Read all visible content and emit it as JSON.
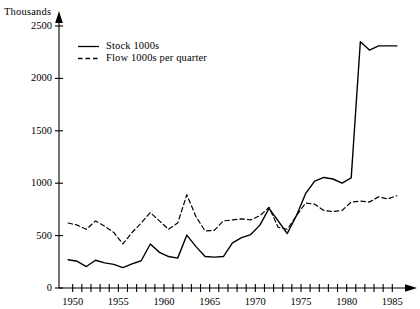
{
  "chart_data": {
    "type": "line",
    "title": "",
    "xlabel": "",
    "ylabel": "Thousands",
    "xlim": [
      1948.5,
      1986.5
    ],
    "ylim": [
      0,
      2500
    ],
    "grid": false,
    "legend_position": "top-left-inside",
    "y_ticks": [
      0,
      500,
      1000,
      1500,
      2000,
      2500
    ],
    "y_tick_labels": [
      "0",
      "500",
      "1000",
      "1500",
      "2000",
      "2500"
    ],
    "x_ticks": [
      1950,
      1951,
      1952,
      1953,
      1954,
      1955,
      1956,
      1957,
      1958,
      1959,
      1960,
      1961,
      1962,
      1963,
      1964,
      1965,
      1966,
      1967,
      1968,
      1969,
      1970,
      1971,
      1972,
      1973,
      1974,
      1975,
      1976,
      1977,
      1978,
      1979,
      1980,
      1981,
      1982,
      1983,
      1984,
      1985
    ],
    "x_tick_labels_shown": [
      "1950",
      "1955",
      "1960",
      "1965",
      "1970",
      "1975",
      "1980",
      "1985"
    ],
    "x_tick_labels_shown_at": [
      1950,
      1955,
      1960,
      1965,
      1970,
      1975,
      1980,
      1985
    ],
    "series": [
      {
        "name": "Stock 1000s",
        "style": "solid",
        "color": "#000000",
        "x": [
          1949.5,
          1950.5,
          1951.5,
          1952.5,
          1953.5,
          1954.5,
          1955.5,
          1956.5,
          1957.5,
          1958.5,
          1959.5,
          1960.5,
          1961.5,
          1962.5,
          1963.5,
          1964.5,
          1965.5,
          1966.5,
          1967.5,
          1968.5,
          1969.5,
          1970.5,
          1971.5,
          1972.5,
          1973.5,
          1974.5,
          1975.5,
          1976.5,
          1977.5,
          1978.5,
          1979.5,
          1980.5,
          1981.5,
          1982.5,
          1983.5,
          1984.5,
          1985.5
        ],
        "values": [
          270,
          255,
          205,
          265,
          240,
          225,
          195,
          230,
          260,
          420,
          340,
          300,
          285,
          505,
          395,
          300,
          295,
          300,
          430,
          480,
          510,
          600,
          760,
          640,
          520,
          690,
          900,
          1020,
          1055,
          1040,
          1000,
          1050,
          2350,
          2270,
          2310,
          2310,
          2310
        ]
      },
      {
        "name": "Flow 1000s per quarter",
        "style": "dashed",
        "color": "#000000",
        "x": [
          1949.5,
          1950.5,
          1951.5,
          1952.5,
          1953.5,
          1954.5,
          1955.5,
          1956.5,
          1957.5,
          1958.5,
          1959.5,
          1960.5,
          1961.5,
          1962.5,
          1963.5,
          1964.5,
          1965.5,
          1966.5,
          1967.5,
          1968.5,
          1969.5,
          1970.5,
          1971.5,
          1972.5,
          1973.5,
          1974.5,
          1975.5,
          1976.5,
          1977.5,
          1978.5,
          1979.5,
          1980.5,
          1981.5,
          1982.5,
          1983.5,
          1984.5,
          1985.5
        ],
        "values": [
          620,
          600,
          560,
          640,
          590,
          530,
          420,
          530,
          620,
          720,
          640,
          560,
          620,
          890,
          680,
          545,
          550,
          640,
          650,
          660,
          650,
          690,
          770,
          580,
          560,
          690,
          810,
          800,
          740,
          730,
          740,
          820,
          830,
          820,
          870,
          850,
          880
        ]
      }
    ],
    "legend": [
      {
        "label": "Stock 1000s",
        "style": "solid"
      },
      {
        "label": "Flow 1000s per quarter",
        "style": "dashed"
      }
    ]
  },
  "axes": {
    "y_title": "Thousands"
  }
}
